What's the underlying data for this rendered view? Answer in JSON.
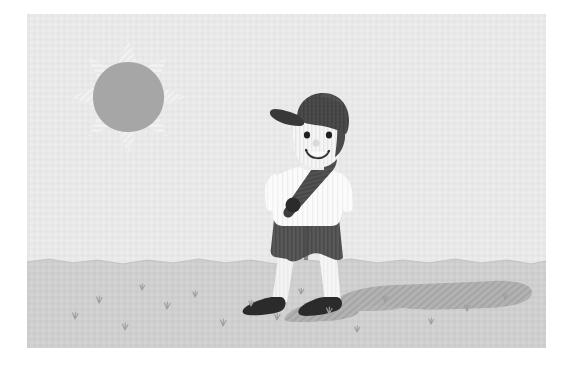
{
  "scene": {
    "title": "Boy walking with a baseball bat on a sunny field",
    "style": "flat textured children's book illustration, monochrome grayscale",
    "canvas": {
      "width": 574,
      "height": 367
    },
    "frame": {
      "left": 27,
      "top": 14,
      "width": 519,
      "height": 334,
      "matte_color": "#ffffff"
    }
  },
  "palette": {
    "matte": "#ffffff",
    "sky": "#e9e9e9",
    "sky_texture": "#e3e3e3",
    "ground": "#cfcfcf",
    "ground_texture": "#c8c8c8",
    "sun_disc": "#a8a8a8",
    "sun_rays": "#f1f1f1",
    "shadow": "#aeaeae",
    "shirt": "#fbfbfb",
    "shirt_shading": "#ececec",
    "skin": "#f4f4f4",
    "skin_shading": "#e2e2e2",
    "cap": "#4a4a4a",
    "cap_brim": "#3a3a3a",
    "hair": "#4a4a4a",
    "shorts": "#555555",
    "shoes": "#2b2b2b",
    "bat": "#4f4f4f",
    "bat_handle": "#3d3d3d",
    "fist": "#2b2b2b",
    "eye": "#1f1f1f",
    "mouth": "#2b2b2b",
    "grass": "#9a9a9a"
  },
  "elements": {
    "sky": {
      "name": "sky",
      "y_top": 0,
      "y_bottom": 244
    },
    "horizon": {
      "name": "horizon-line",
      "y": 244,
      "irregular": true
    },
    "ground": {
      "name": "ground",
      "y_top": 244,
      "y_bottom": 334
    },
    "sun": {
      "name": "sun",
      "center_x": 101,
      "center_y": 83,
      "disc_radius": 35,
      "ray_count": 8,
      "ray_outer_radius": 58
    },
    "boy": {
      "name": "boy-character",
      "pose": "walking left to right, bat over shoulder",
      "head_center_x": 300,
      "head_center_y": 122,
      "total_height": 218
    },
    "bat": {
      "name": "baseball-bat",
      "angle_deg": -52,
      "length": 112,
      "barrel_width": 13,
      "handle_width": 6
    },
    "shadow": {
      "name": "cast-shadow",
      "direction": "to the right",
      "x_start": 320,
      "x_end": 500,
      "y_center": 288
    },
    "grass_tufts": {
      "name": "grass-tufts",
      "count": 16,
      "positions": [
        [
          48,
          305
        ],
        [
          72,
          289
        ],
        [
          98,
          316
        ],
        [
          115,
          276
        ],
        [
          140,
          295
        ],
        [
          168,
          283
        ],
        [
          196,
          312
        ],
        [
          224,
          292
        ],
        [
          250,
          306
        ],
        [
          274,
          280
        ],
        [
          302,
          300
        ],
        [
          330,
          318
        ],
        [
          358,
          288
        ],
        [
          404,
          310
        ],
        [
          440,
          297
        ],
        [
          478,
          285
        ]
      ]
    }
  },
  "annotations": {
    "has_text": false,
    "text_items": []
  }
}
